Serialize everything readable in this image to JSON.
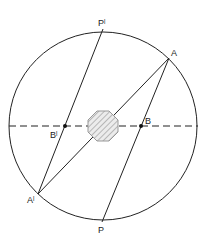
{
  "diagram": {
    "labels": {
      "P_prime": "Pˡ",
      "A": "A",
      "B": "B",
      "B_prime": "Bˡ",
      "A_prime": "Aˡ",
      "P": "P"
    },
    "colors": {
      "stroke": "#222222",
      "obstacle_fill": "#e6e6e6",
      "obstacle_stroke": "#999999"
    }
  }
}
